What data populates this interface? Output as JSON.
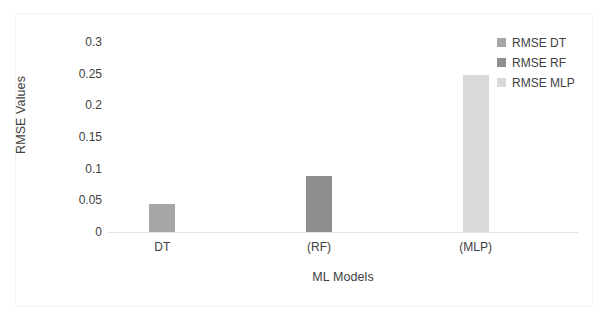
{
  "chart_data": {
    "type": "bar",
    "title": "",
    "subtitle": "",
    "categories": [
      "DT",
      "(RF)",
      "(MLP)"
    ],
    "values": [
      0.045,
      0.089,
      0.248
    ],
    "series": [
      {
        "name": "RMSE DT",
        "values": [
          0.045,
          null,
          null
        ],
        "color": "#a6a6a6"
      },
      {
        "name": "RMSE RF",
        "values": [
          null,
          0.089,
          null
        ],
        "color": "#8e8e8e"
      },
      {
        "name": "RMSE MLP",
        "values": [
          null,
          null,
          0.248
        ],
        "color": "#d9d9d9"
      }
    ],
    "xlabel": "ML Models",
    "ylabel": "RMSE Values",
    "ylim": [
      0,
      0.3
    ],
    "yticks": [
      0,
      0.05,
      0.1,
      0.15,
      0.2,
      0.25,
      0.3
    ],
    "ytick_labels": [
      "0",
      "0.05",
      "0.1",
      "0.15",
      "0.2",
      "0.25",
      "0.3"
    ],
    "grid": false,
    "legend_position": "top-right",
    "legend": [
      {
        "label": "RMSE DT",
        "color": "#a6a6a6"
      },
      {
        "label": "RMSE RF",
        "color": "#8e8e8e"
      },
      {
        "label": "RMSE MLP",
        "color": "#d9d9d9"
      }
    ],
    "bars": [
      {
        "category": "DT",
        "label": "RMSE DT",
        "value": 0.045,
        "color": "#a6a6a6"
      },
      {
        "category": "(RF)",
        "label": "RMSE RF",
        "value": 0.089,
        "color": "#8e8e8e"
      },
      {
        "category": "(MLP)",
        "label": "RMSE MLP",
        "value": 0.248,
        "color": "#d9d9d9"
      }
    ]
  },
  "axes": {
    "x_title": "ML Models",
    "y_title": "RMSE Values"
  },
  "colors": {
    "axis_line": "#e2e2e2",
    "frame": "#f4f4f4",
    "text": "#404040",
    "background": "#ffffff"
  }
}
